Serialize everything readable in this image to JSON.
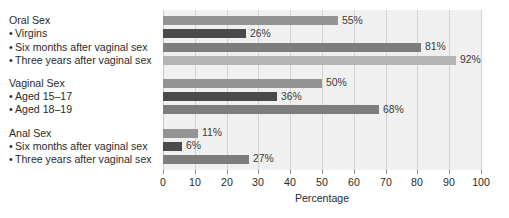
{
  "chart_data": {
    "type": "bar",
    "orientation": "horizontal",
    "title": "",
    "xlabel": "Percentage",
    "ylabel": "",
    "xlim": [
      0,
      100
    ],
    "xticks": [
      0,
      10,
      20,
      30,
      40,
      50,
      60,
      70,
      80,
      90,
      100
    ],
    "grid": true,
    "legend": "none",
    "value_suffix": "%",
    "groups": [
      {
        "name": "Oral Sex",
        "rows": [
          {
            "label": "Oral Sex",
            "is_header": true,
            "value": 55,
            "value_label": "55%",
            "color": "#949494"
          },
          {
            "label": "Virgins",
            "is_header": false,
            "value": 26,
            "value_label": "26%",
            "color": "#4a4a4a"
          },
          {
            "label": "Six months after vaginal sex",
            "is_header": false,
            "value": 81,
            "value_label": "81%",
            "color": "#7d7d7d"
          },
          {
            "label": "Three years after vaginal sex",
            "is_header": false,
            "value": 92,
            "value_label": "92%",
            "color": "#b4b4b4"
          }
        ]
      },
      {
        "name": "Vaginal Sex",
        "rows": [
          {
            "label": "Vaginal Sex",
            "is_header": true,
            "value": 50,
            "value_label": "50%",
            "color": "#949494"
          },
          {
            "label": "Aged 15–17",
            "is_header": false,
            "value": 36,
            "value_label": "36%",
            "color": "#4a4a4a"
          },
          {
            "label": "Aged 18–19",
            "is_header": false,
            "value": 68,
            "value_label": "68%",
            "color": "#7d7d7d"
          }
        ]
      },
      {
        "name": "Anal Sex",
        "rows": [
          {
            "label": "Anal Sex",
            "is_header": true,
            "value": 11,
            "value_label": "11%",
            "color": "#949494"
          },
          {
            "label": "Six months after vaginal sex",
            "is_header": false,
            "value": 6,
            "value_label": "6%",
            "color": "#4a4a4a"
          },
          {
            "label": "Three years after vaginal sex",
            "is_header": false,
            "value": 27,
            "value_label": "27%",
            "color": "#7d7d7d"
          }
        ]
      }
    ],
    "categories": [
      "Oral Sex",
      "Oral Sex – Virgins",
      "Oral Sex – Six months after vaginal sex",
      "Oral Sex – Three years after vaginal sex",
      "Vaginal Sex",
      "Vaginal Sex – Aged 15–17",
      "Vaginal Sex – Aged 18–19",
      "Anal Sex",
      "Anal Sex – Six months after vaginal sex",
      "Anal Sex – Three years after vaginal sex"
    ],
    "values": [
      55,
      26,
      81,
      92,
      50,
      36,
      68,
      11,
      6,
      27
    ],
    "bullet_glyph": "•",
    "colors": {
      "plot_background": "#f0f0f0",
      "gridline": "#d2d2d2",
      "text": "#2b2b2b",
      "value_text": "#3a3a3a",
      "bar_light": "#b4b4b4",
      "bar_medium": "#949494",
      "bar_mid_dark": "#7d7d7d",
      "bar_dark": "#4a4a4a"
    }
  }
}
